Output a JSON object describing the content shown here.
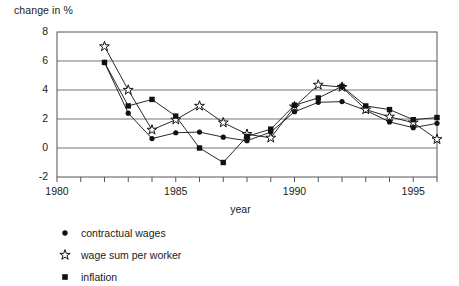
{
  "chart_data": {
    "type": "line",
    "title": "",
    "ylabel": "change in %",
    "xlabel": "year",
    "x": [
      1982,
      1983,
      1984,
      1985,
      1986,
      1987,
      1988,
      1989,
      1990,
      1991,
      1992,
      1993,
      1994,
      1995,
      1996
    ],
    "xlim": [
      1980,
      1996
    ],
    "ylim": [
      -2,
      8
    ],
    "yticks": [
      -2,
      0,
      2,
      4,
      6,
      8
    ],
    "xticks": [
      1980,
      1985,
      1990,
      1995
    ],
    "xtick_labels": [
      "1980",
      "1985",
      "1990",
      "1995"
    ],
    "ytick_labels": [
      "8",
      "6",
      "4",
      "2",
      "0",
      "-2"
    ],
    "grid": true,
    "legend_position": "below",
    "series": [
      {
        "name": "contractual wages",
        "marker": "filled-circle",
        "values": [
          5.9,
          2.4,
          0.65,
          1.05,
          1.1,
          0.75,
          0.5,
          1.1,
          2.5,
          3.15,
          3.2,
          2.6,
          1.8,
          1.4,
          1.7
        ]
      },
      {
        "name": "wage sum per worker",
        "marker": "open-star",
        "values": [
          7.0,
          4.0,
          1.25,
          1.95,
          2.9,
          1.75,
          0.95,
          0.7,
          2.85,
          4.35,
          4.2,
          2.65,
          2.15,
          1.75,
          0.6
        ]
      },
      {
        "name": "inflation",
        "marker": "filled-square",
        "values": [
          5.9,
          2.9,
          3.35,
          2.2,
          0.0,
          -1.0,
          0.8,
          1.3,
          2.95,
          3.45,
          4.25,
          2.9,
          2.65,
          1.95,
          2.1
        ]
      }
    ]
  },
  "legend": {
    "items": [
      {
        "label": "contractual wages",
        "marker": "filled-circle"
      },
      {
        "label": "wage sum per worker",
        "marker": "open-star"
      },
      {
        "label": "inflation",
        "marker": "filled-square"
      }
    ]
  },
  "colors": {
    "line": "#111111",
    "grid": "#666666",
    "axis": "#555555",
    "text": "#1a1a1a",
    "background": "#ffffff"
  }
}
